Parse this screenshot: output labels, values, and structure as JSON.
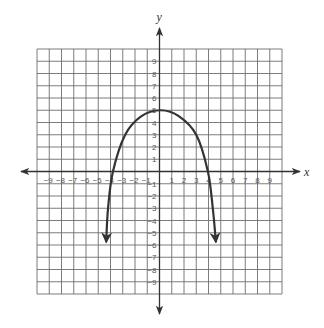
{
  "chart_data": {
    "type": "line",
    "title": "",
    "xlabel": "x",
    "ylabel": "y",
    "xlim": [
      -10,
      10
    ],
    "ylim": [
      -10,
      10
    ],
    "grid": true,
    "x_ticks": [
      -9,
      -8,
      -7,
      -6,
      -5,
      -4,
      -3,
      -2,
      -1,
      1,
      2,
      3,
      4,
      5,
      6,
      7,
      8,
      9
    ],
    "y_ticks": [
      9,
      8,
      7,
      6,
      5,
      4,
      3,
      2,
      1,
      -1,
      -2,
      -3,
      -4,
      -5,
      -6,
      -7,
      -8,
      -9
    ],
    "x_tick_labels": [
      "−9",
      "−8",
      "−7",
      "−6",
      "−5",
      "−4",
      "−3",
      "−2",
      "−1",
      "1",
      "2",
      "3",
      "4",
      "5",
      "6",
      "7",
      "8",
      "9"
    ],
    "y_tick_labels": [
      "9",
      "8",
      "7",
      "6",
      "5",
      "4",
      "3",
      "2",
      "1",
      "−1",
      "−2",
      "−3",
      "−4",
      "−5",
      "−6",
      "−7",
      "−8",
      "−9"
    ],
    "series": [
      {
        "name": "downward parabola",
        "description": "Concave-down curve with vertex near (0, 5), x-intercepts near -3.8 and 4, arrows on both ends",
        "points": [
          [
            -4.35,
            -5.7
          ],
          [
            -4.2,
            -3
          ],
          [
            -3.8,
            0
          ],
          [
            -2.8,
            3
          ],
          [
            -1.5,
            4.5
          ],
          [
            0.1,
            5
          ],
          [
            1.6,
            4.5
          ],
          [
            3.0,
            3
          ],
          [
            3.95,
            0
          ],
          [
            4.35,
            -3
          ],
          [
            4.6,
            -5.7
          ]
        ],
        "arrow_start": true,
        "arrow_end": true
      }
    ]
  }
}
